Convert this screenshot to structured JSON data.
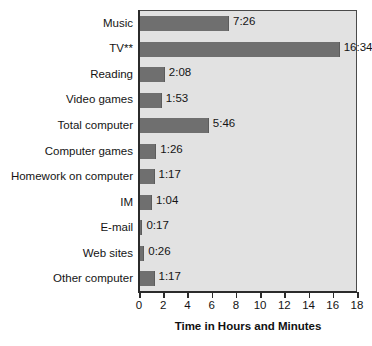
{
  "chart_data": {
    "type": "bar",
    "orientation": "horizontal",
    "title": "",
    "xlabel": "Time in Hours and Minutes",
    "ylabel": "",
    "xlim": [
      0,
      18
    ],
    "xticks": [
      "0",
      "2",
      "4",
      "6",
      "8",
      "10",
      "12",
      "14",
      "16",
      "18"
    ],
    "grid": false,
    "legend": false,
    "categories": [
      "Music",
      "TV**",
      "Reading",
      "Video games",
      "Total computer",
      "Computer games",
      "Homework on computer",
      "IM",
      "E-mail",
      "Web sites",
      "Other computer"
    ],
    "values": [
      7.433,
      16.567,
      2.133,
      1.883,
      5.767,
      1.433,
      1.283,
      1.067,
      0.283,
      0.433,
      1.283
    ],
    "value_labels": [
      "7:26",
      "16:34",
      "2:08",
      "1:53",
      "5:46",
      "1:26",
      "1:17",
      "1:04",
      "0:17",
      "0:26",
      "1:17"
    ],
    "colors": {
      "bar": "#6f6f6f",
      "plot_background": "#e2e2e2",
      "axis": "#2b2b2b",
      "text": "#141414"
    }
  }
}
